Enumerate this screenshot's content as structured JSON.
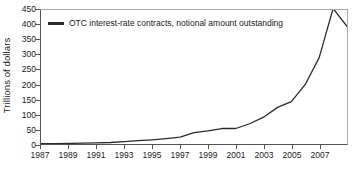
{
  "chart_data": {
    "type": "line",
    "title": "",
    "xlabel": "",
    "ylabel": "Trillions of dollars",
    "xlim": [
      1987,
      2009
    ],
    "ylim": [
      0,
      450
    ],
    "grid": false,
    "legend_position": "top-left",
    "xticks": [
      "1987",
      "1989",
      "1991",
      "1993",
      "1995",
      "1997",
      "1999",
      "2001",
      "2003",
      "2005",
      "2007"
    ],
    "xtick_values": [
      1987,
      1989,
      1991,
      1993,
      1995,
      1997,
      1999,
      2001,
      2003,
      2005,
      2007
    ],
    "yticks": [
      "0",
      "50",
      "100",
      "150",
      "200",
      "250",
      "300",
      "350",
      "400",
      "450"
    ],
    "ytick_values": [
      0,
      50,
      100,
      150,
      200,
      250,
      300,
      350,
      400,
      450
    ],
    "series": [
      {
        "name": "OTC interest-rate contracts, notional amount outstanding",
        "color": "#2b2b2b",
        "x": [
          1987,
          1988,
          1989,
          1990,
          1991,
          1992,
          1993,
          1994,
          1995,
          1996,
          1997,
          1998,
          1999,
          2000,
          2001,
          2002,
          2003,
          2004,
          2005,
          2006,
          2007,
          2008,
          2009
        ],
        "values": [
          1,
          1,
          2,
          3,
          4,
          5,
          8,
          11,
          14,
          18,
          23,
          38,
          44,
          52,
          52,
          68,
          90,
          123,
          142,
          200,
          290,
          455,
          395
        ]
      }
    ]
  },
  "legend": {
    "entries": [
      {
        "label": "OTC interest-rate contracts, notional amount outstanding",
        "color": "#2b2b2b"
      }
    ]
  },
  "axes": {
    "y_title": "Trillions of dollars"
  }
}
